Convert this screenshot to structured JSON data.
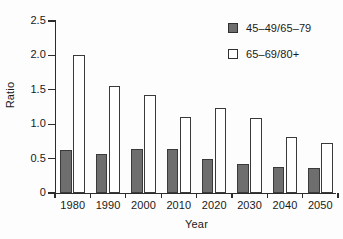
{
  "chart_data": {
    "type": "bar",
    "title": "",
    "xlabel": "Year",
    "ylabel": "Ratio",
    "categories": [
      "1980",
      "1990",
      "2000",
      "2010",
      "2020",
      "2030",
      "2040",
      "2050"
    ],
    "series": [
      {
        "name": "45–49/65–79",
        "style": "filled-gray",
        "color": "#6e6e6e",
        "values": [
          0.62,
          0.57,
          0.64,
          0.64,
          0.49,
          0.42,
          0.38,
          0.37
        ]
      },
      {
        "name": "65–69/80+",
        "style": "hollow-white",
        "color": "#ffffff",
        "values": [
          2.0,
          1.56,
          1.42,
          1.11,
          1.24,
          1.09,
          0.82,
          0.73
        ]
      }
    ],
    "ylim": [
      0,
      2.5
    ],
    "ytick_labels": [
      "0",
      "0.5",
      "1.0",
      "1.5",
      "2.0",
      "2.5"
    ],
    "ytick_values": [
      0,
      0.5,
      1.0,
      1.5,
      2.0,
      2.5
    ],
    "grid": false,
    "legend_position": "top-right",
    "axis_color": "#2b2b2b",
    "bar_border_color": "#3a3a3a"
  },
  "legend": {
    "items": [
      {
        "label": "45–49/65–79",
        "swatch": "filled"
      },
      {
        "label": "65–69/80+",
        "swatch": "hollow"
      }
    ]
  }
}
